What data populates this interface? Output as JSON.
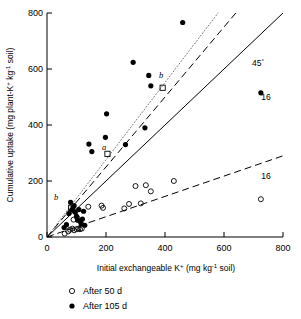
{
  "chart_data": {
    "type": "scatter",
    "title": "",
    "xlabel": "Initial exchangeable K+ (mg kg-1 soil)",
    "ylabel": "Cumulative uptake (mg plant-K+ kg-1 soil)",
    "xlim": [
      0,
      800
    ],
    "ylim": [
      0,
      800
    ],
    "xticks": [
      0,
      200,
      400,
      600,
      800
    ],
    "yticks": [
      0,
      200,
      400,
      600,
      800
    ],
    "grid": false,
    "legend_position": "below-axis",
    "series": [
      {
        "name": "After 50 d",
        "marker": "open-circle",
        "points": [
          [
            60,
            12
          ],
          [
            72,
            20
          ],
          [
            78,
            26
          ],
          [
            86,
            30
          ],
          [
            92,
            24
          ],
          [
            100,
            28
          ],
          [
            106,
            30
          ],
          [
            112,
            28
          ],
          [
            118,
            30
          ],
          [
            90,
            62
          ],
          [
            102,
            70
          ],
          [
            140,
            108
          ],
          [
            185,
            112
          ],
          [
            190,
            104
          ],
          [
            262,
            102
          ],
          [
            278,
            118
          ],
          [
            300,
            182
          ],
          [
            318,
            120
          ],
          [
            335,
            185
          ],
          [
            352,
            163
          ],
          [
            430,
            200
          ],
          [
            725,
            135
          ]
        ]
      },
      {
        "name": "After 105 d",
        "marker": "filled-circle",
        "points": [
          [
            58,
            34
          ],
          [
            66,
            44
          ],
          [
            74,
            84
          ],
          [
            80,
            124
          ],
          [
            84,
            96
          ],
          [
            88,
            104
          ],
          [
            92,
            112
          ],
          [
            96,
            88
          ],
          [
            100,
            74
          ],
          [
            104,
            60
          ],
          [
            108,
            98
          ],
          [
            112,
            56
          ],
          [
            116,
            48
          ],
          [
            120,
            64
          ],
          [
            124,
            92
          ],
          [
            128,
            42
          ],
          [
            142,
            332
          ],
          [
            152,
            305
          ],
          [
            198,
            356
          ],
          [
            202,
            440
          ],
          [
            266,
            330
          ],
          [
            292,
            624
          ],
          [
            332,
            390
          ],
          [
            345,
            577
          ],
          [
            352,
            540
          ],
          [
            460,
            766
          ],
          [
            725,
            515
          ]
        ]
      }
    ],
    "square_markers": [
      {
        "label": "a",
        "x": 205,
        "y": 297
      },
      {
        "label": "b",
        "x": 392,
        "y": 533
      },
      {
        "label": "b",
        "x": 82,
        "y": 104
      }
    ],
    "lines": [
      {
        "name": "one-to-one",
        "style": "solid",
        "x": [
          0,
          800
        ],
        "y": [
          0,
          800
        ],
        "label": "45"
      },
      {
        "name": "dotted-upper",
        "style": "dotted",
        "x": [
          0,
          580
        ],
        "y": [
          0,
          800
        ]
      },
      {
        "name": "dashed-105d",
        "style": "dashed",
        "x": [
          0,
          640
        ],
        "y": [
          0,
          800
        ]
      },
      {
        "name": "dashed-50d",
        "style": "dashed",
        "x": [
          0,
          800
        ],
        "y": [
          0,
          290
        ]
      }
    ],
    "annotations": [
      {
        "text": "45",
        "superscript": "°",
        "x": 690,
        "y": 690
      },
      {
        "text": "16",
        "x": 725,
        "y": 565
      },
      {
        "text": "16",
        "x": 725,
        "y": 182
      }
    ]
  },
  "axes": {
    "x": {
      "label_main": "Initial exchangeable K",
      "label_sup1": "+",
      "label_mid": " (mg kg",
      "label_sup2": "-1",
      "label_end": " soil)",
      "ticks": [
        "0",
        "200",
        "400",
        "600",
        "800"
      ]
    },
    "y": {
      "label_main": "Cumulative uptake (mg plant-K",
      "label_sup1": "+",
      "label_mid": " kg",
      "label_sup2": "-1",
      "label_end": " soil)",
      "ticks": [
        "0",
        "200",
        "400",
        "600",
        "800"
      ]
    }
  },
  "legend": {
    "items": [
      {
        "marker": "open-circle",
        "label": "After 50 d"
      },
      {
        "marker": "filled-circle",
        "label": "After 105 d"
      }
    ]
  },
  "annotation_labels": {
    "angle": "45",
    "angle_sup": "°",
    "count_upper": "16",
    "count_lower": "16",
    "letter_a": "a",
    "letter_b_upper": "b",
    "letter_b_lower": "b"
  }
}
